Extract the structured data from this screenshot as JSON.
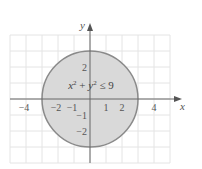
{
  "chart_data": {
    "type": "region",
    "title": "",
    "xlabel": "x",
    "ylabel": "y",
    "xlim": [
      -5,
      5
    ],
    "ylim": [
      -4,
      4
    ],
    "grid": true,
    "x_ticks": [
      {
        "value": -4,
        "label": "−4"
      },
      {
        "value": -2,
        "label": "−2"
      },
      {
        "value": -1,
        "label": "−1"
      },
      {
        "value": 1,
        "label": "1"
      },
      {
        "value": 2,
        "label": "2"
      },
      {
        "value": 4,
        "label": "4"
      }
    ],
    "y_ticks": [
      {
        "value": 2,
        "label": "2"
      },
      {
        "value": -1,
        "label": "−1"
      },
      {
        "value": -2,
        "label": "−2"
      }
    ],
    "region": {
      "shape": "disk",
      "center": [
        0,
        0
      ],
      "radius": 3,
      "inequality": "x² + y² ≤ 9",
      "fill": "#d9d9d9",
      "stroke": "#8a8a8a"
    }
  },
  "colors": {
    "grid": "#e4e4e4",
    "axis": "#666666"
  }
}
